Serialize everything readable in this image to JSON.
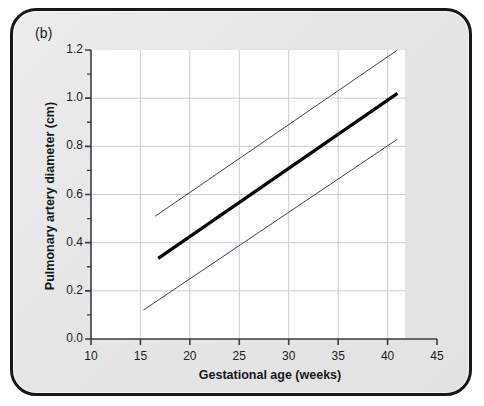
{
  "figure": {
    "panel_label": "(b)",
    "background_color": "#e8e8e9",
    "frame_color": "#15181c",
    "plot_background": "#ffffff",
    "grid_color": "#c9cdd4",
    "axis_color": "#3a3d42"
  },
  "chart_data": {
    "type": "line",
    "title": "",
    "subtitle": "",
    "panel": "(b)",
    "xlabel": "Gestational age (weeks)",
    "ylabel": "Pulmonary artery diameter (cm)",
    "xlim": [
      10,
      45
    ],
    "ylim": [
      0.0,
      1.2
    ],
    "grid": true,
    "legend_position": "none",
    "xticks": [
      10,
      15,
      20,
      25,
      30,
      35,
      40,
      45
    ],
    "xtick_labels": [
      "10",
      "15",
      "20",
      "25",
      "30",
      "35",
      "40",
      "45"
    ],
    "yticks": [
      0.0,
      0.2,
      0.4,
      0.6,
      0.8,
      1.0,
      1.2
    ],
    "ytick_labels": [
      "0.0",
      "0.2",
      "0.4",
      "0.6",
      "0.8",
      "1.0",
      "1.2"
    ],
    "y_minor_ticks": [
      0.1,
      0.3,
      0.5,
      0.7,
      0.9,
      1.1
    ],
    "x_grid_values": [
      15,
      20,
      25,
      30,
      35,
      40
    ],
    "y_grid_values": [
      0.2,
      0.4,
      0.6,
      0.8,
      1.0
    ],
    "series": [
      {
        "name": "upper reference limit",
        "style": "thin",
        "color": "#404349",
        "width": 1,
        "x": [
          16.5,
          41.0
        ],
        "values": [
          0.51,
          1.2
        ]
      },
      {
        "name": "mean",
        "style": "thick",
        "color": "#050608",
        "width": 3.2,
        "x": [
          16.8,
          41.0
        ],
        "values": [
          0.335,
          1.02
        ]
      },
      {
        "name": "lower reference limit",
        "style": "thin",
        "color": "#404349",
        "width": 1,
        "x": [
          15.3,
          41.0
        ],
        "values": [
          0.12,
          0.83
        ]
      }
    ]
  }
}
